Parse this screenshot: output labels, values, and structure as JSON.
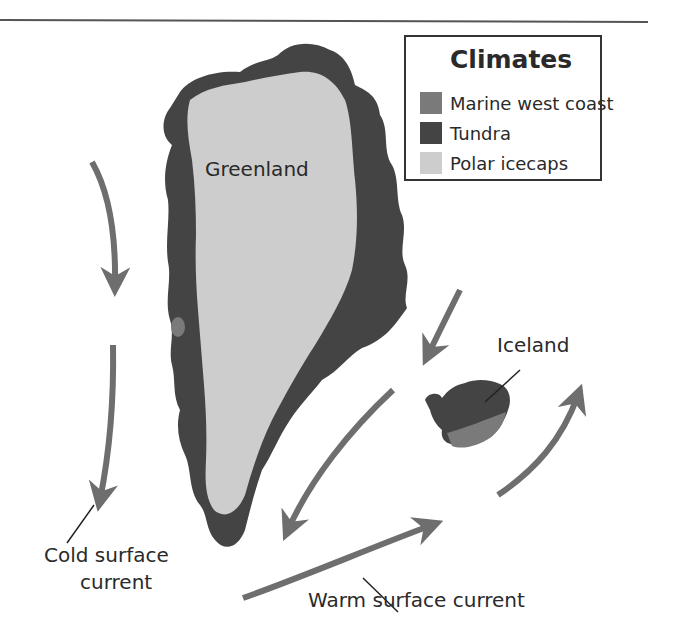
{
  "legend": {
    "title": "Climates",
    "items": [
      {
        "label": "Marine west coast",
        "color": "#7a7a7a"
      },
      {
        "label": "Tundra",
        "color": "#444444"
      },
      {
        "label": "Polar icecaps",
        "color": "#cdcdcd"
      }
    ]
  },
  "labels": {
    "greenland": "Greenland",
    "iceland": "Iceland",
    "cold_current_line1": "Cold surface",
    "cold_current_line2": "current",
    "warm_current": "Warm surface current"
  },
  "colors": {
    "current_arrow": "#6e6e6e",
    "tundra": "#444444",
    "icecap": "#cdcdcd",
    "marine": "#7a7a7a"
  }
}
